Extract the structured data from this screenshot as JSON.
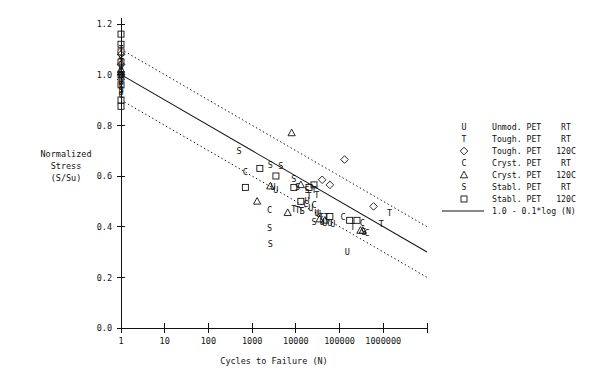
{
  "chart_data": {
    "type": "scatter",
    "title": "",
    "xlabel": "Cycles to Failure (N)",
    "ylabel": "Normalized Stress (S/Su)",
    "ylabel_lines": [
      "Normalized",
      "Stress",
      "(S/Su)"
    ],
    "xscale": "log",
    "yscale": "linear",
    "xlim": [
      1,
      10000000
    ],
    "ylim": [
      0.0,
      1.2
    ],
    "xticks": [
      1,
      10,
      100,
      1000,
      10000,
      100000,
      1000000
    ],
    "xticklabels": [
      "1",
      "10",
      "100",
      "1000",
      "10000",
      "100000",
      "1000000"
    ],
    "yticks": [
      0.0,
      0.2,
      0.4,
      0.6,
      0.8,
      1.0,
      1.2
    ],
    "yticklabels": [
      "0.0",
      "0.2",
      "0.4",
      "0.6",
      "0.8",
      "1.0",
      "1.2"
    ],
    "grid": false,
    "legend_position": "right",
    "fit_line": {
      "label": "1.0 - 0.1*log (N)",
      "intercept": 1.0,
      "slope": -0.1,
      "x_start": 1,
      "x_end": 10000000
    },
    "bounds": [
      {
        "name": "upper",
        "offset": 0.1
      },
      {
        "name": "lower",
        "offset": -0.1
      }
    ],
    "series": [
      {
        "name": "Unmod. PET RT",
        "marker": "U",
        "symbol": "text",
        "points": [
          [
            1,
            1.03
          ],
          [
            1,
            1.0
          ],
          [
            1,
            0.97
          ],
          [
            1,
            0.93
          ],
          [
            3000,
            0.555
          ],
          [
            3500,
            0.545
          ],
          [
            18000,
            0.5
          ],
          [
            22000,
            0.475
          ],
          [
            30000,
            0.455
          ],
          [
            33000,
            0.45
          ],
          [
            40000,
            0.42
          ],
          [
            46000,
            0.415
          ],
          [
            60000,
            0.415
          ],
          [
            70000,
            0.41
          ],
          [
            150000,
            0.3
          ]
        ]
      },
      {
        "name": "Tough. PET RT",
        "marker": "T",
        "symbol": "text",
        "points": [
          [
            1,
            1.1
          ],
          [
            1,
            1.05
          ],
          [
            1,
            1.0
          ],
          [
            1,
            0.95
          ],
          [
            9000,
            0.47
          ],
          [
            11000,
            0.465
          ],
          [
            13000,
            0.46
          ],
          [
            20000,
            0.52
          ],
          [
            26000,
            0.545
          ],
          [
            30000,
            0.525
          ],
          [
            38000,
            0.44
          ],
          [
            50000,
            0.44
          ],
          [
            200000,
            0.4
          ],
          [
            900000,
            0.41
          ],
          [
            1400000,
            0.455
          ]
        ]
      },
      {
        "name": "Tough. PET 120C",
        "marker": "diamond",
        "symbol": "diamond",
        "points": [
          [
            1,
            1.08
          ],
          [
            1,
            1.04
          ],
          [
            1,
            1.0
          ],
          [
            40000,
            0.585
          ],
          [
            60000,
            0.565
          ],
          [
            130000,
            0.665
          ],
          [
            600000,
            0.48
          ]
        ]
      },
      {
        "name": "Cryst. PET RT",
        "marker": "C",
        "symbol": "text",
        "points": [
          [
            1,
            1.0
          ],
          [
            1,
            0.96
          ],
          [
            1,
            0.92
          ],
          [
            700,
            0.615
          ],
          [
            2500,
            0.465
          ],
          [
            17000,
            0.49
          ],
          [
            26000,
            0.485
          ],
          [
            120000,
            0.44
          ],
          [
            330000,
            0.415
          ],
          [
            420000,
            0.375
          ]
        ]
      },
      {
        "name": "Cryst. PET 120C",
        "marker": "triangle",
        "symbol": "triangle",
        "points": [
          [
            1,
            1.02
          ],
          [
            1,
            0.99
          ],
          [
            1300,
            0.5
          ],
          [
            2600,
            0.56
          ],
          [
            13000,
            0.565
          ],
          [
            35000,
            0.43
          ],
          [
            46000,
            0.425
          ],
          [
            300000,
            0.385
          ],
          [
            340000,
            0.385
          ],
          [
            6500,
            0.455
          ],
          [
            8000,
            0.77
          ]
        ]
      },
      {
        "name": "Stabl. PET RT",
        "marker": "S",
        "symbol": "text",
        "points": [
          [
            1,
            1.06
          ],
          [
            1,
            1.01
          ],
          [
            1,
            0.94
          ],
          [
            500,
            0.7
          ],
          [
            2600,
            0.645
          ],
          [
            4500,
            0.64
          ],
          [
            9000,
            0.59
          ],
          [
            11000,
            0.555
          ],
          [
            14000,
            0.46
          ],
          [
            18000,
            0.545
          ],
          [
            2500,
            0.395
          ],
          [
            2600,
            0.33
          ],
          [
            26000,
            0.42
          ],
          [
            360000,
            0.38
          ]
        ]
      },
      {
        "name": "Stabl. PET 120C",
        "marker": "square",
        "symbol": "square",
        "points": [
          [
            1,
            1.16
          ],
          [
            1,
            1.12
          ],
          [
            1,
            1.09
          ],
          [
            1,
            1.05
          ],
          [
            1,
            1.0
          ],
          [
            1,
            0.96
          ],
          [
            1,
            0.9
          ],
          [
            1,
            0.875
          ],
          [
            700,
            0.555
          ],
          [
            1500,
            0.63
          ],
          [
            3500,
            0.6
          ],
          [
            9000,
            0.555
          ],
          [
            13000,
            0.5
          ],
          [
            20000,
            0.555
          ],
          [
            26000,
            0.565
          ],
          [
            60000,
            0.44
          ],
          [
            170000,
            0.425
          ],
          [
            250000,
            0.425
          ]
        ]
      }
    ]
  },
  "legend": {
    "entries": [
      {
        "marker": "U",
        "symbol": "text",
        "material": "Unmod. PET",
        "temp": "RT"
      },
      {
        "marker": "T",
        "symbol": "text",
        "material": "Tough. PET",
        "temp": "RT"
      },
      {
        "marker": "",
        "symbol": "diamond",
        "material": "Tough. PET",
        "temp": "120C"
      },
      {
        "marker": "C",
        "symbol": "text",
        "material": "Cryst. PET",
        "temp": "RT"
      },
      {
        "marker": "",
        "symbol": "triangle",
        "material": "Cryst. PET",
        "temp": "120C"
      },
      {
        "marker": "S",
        "symbol": "text",
        "material": "Stabl. PET",
        "temp": "RT"
      },
      {
        "marker": "",
        "symbol": "square",
        "material": "Stabl. PET",
        "temp": "120C"
      }
    ],
    "line_label": "1.0 - 0.1*log (N)"
  },
  "colors": {
    "ink": "#111111",
    "background": "#ffffff"
  }
}
